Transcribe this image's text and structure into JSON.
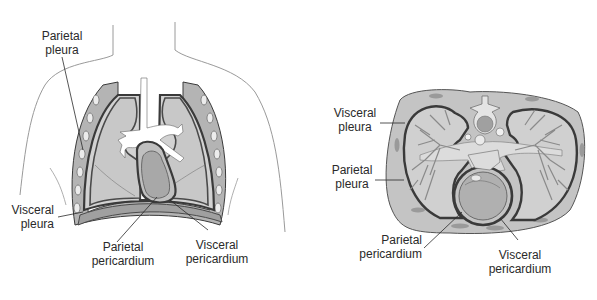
{
  "figure_left": {
    "title": "Frontal view of thorax showing pleurae and pericardium",
    "labels": {
      "parietal_pleura": [
        "Parietal",
        "pleura"
      ],
      "visceral_pleura": [
        "Visceral",
        "pleura"
      ],
      "parietal_pericardium": [
        "Parietal",
        "pericardium"
      ],
      "visceral_pericardium": [
        "Visceral",
        "pericardium"
      ]
    }
  },
  "figure_right": {
    "title": "Transverse section of thorax",
    "labels": {
      "visceral_pleura": [
        "Visceral",
        "pleura"
      ],
      "parietal_pleura": [
        "Parietal",
        "pleura"
      ],
      "parietal_pericardium": [
        "Parietal",
        "pericardium"
      ],
      "visceral_pericardium": [
        "Visceral",
        "pericardium"
      ]
    }
  },
  "colors": {
    "outline": "#3a3a3a",
    "lung_fill": "#c8c8c8",
    "chest_wall": "#b4b4b4",
    "membrane": "#4a4a4a",
    "airway": "#ffffff",
    "heart": "#a8a8a8",
    "body_outline": "#9a9a9a"
  }
}
